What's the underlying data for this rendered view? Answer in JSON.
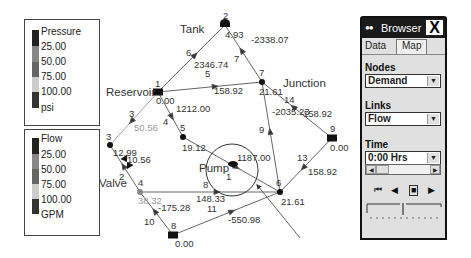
{
  "pressure_legend": {
    "title": "Pressure",
    "ticks": [
      "25.00",
      "50.00",
      "75.00",
      "100.00"
    ],
    "unit": "psi",
    "colors": [
      "#222222",
      "#888888",
      "#666666",
      "#cccccc",
      "#333333"
    ]
  },
  "flow_legend": {
    "title": "Flow",
    "ticks": [
      "25.00",
      "50.00",
      "75.00",
      "100.00"
    ],
    "unit": "GPM",
    "colors": [
      "#222222",
      "#888888",
      "#666666",
      "#cccccc",
      "#333333"
    ]
  },
  "network": {
    "names": {
      "tank": "Tank",
      "reservoir": "Reservoir",
      "junction": "Junction",
      "pump": "Pump",
      "valve": "Valve"
    },
    "nodes": [
      {
        "id": "1",
        "type": "reservoir",
        "value": "0.00"
      },
      {
        "id": "2",
        "type": "tank",
        "value": "4.93"
      },
      {
        "id": "3",
        "type": "junction",
        "value": "12.99"
      },
      {
        "id": "4",
        "type": "junction",
        "value": "38.32"
      },
      {
        "id": "5",
        "type": "junction",
        "value": "19.12"
      },
      {
        "id": "6",
        "type": "junction",
        "value": "21.61"
      },
      {
        "id": "7",
        "type": "junction",
        "value": "21.61"
      },
      {
        "id": "8",
        "type": "reservoir",
        "value": "0.00"
      },
      {
        "id": "9",
        "type": "reservoir",
        "value": "0.00"
      }
    ],
    "links": [
      {
        "id": "1",
        "type": "pump",
        "value": "1187.00"
      },
      {
        "id": "2",
        "type": "valve",
        "value": "10.56"
      },
      {
        "id": "3",
        "type": "pipe",
        "value": "50.56"
      },
      {
        "id": "4",
        "type": "pipe",
        "value": "1212.00"
      },
      {
        "id": "5",
        "type": "pipe",
        "value": "158.92"
      },
      {
        "id": "6",
        "type": "pipe",
        "value": "2346.74"
      },
      {
        "id": "7",
        "type": "pipe",
        "value": "-2338.07"
      },
      {
        "id": "8",
        "type": "pipe",
        "value": "148.33"
      },
      {
        "id": "9",
        "type": "pipe",
        "value": "-2035.23"
      },
      {
        "id": "10",
        "type": "pipe",
        "value": "-175.28"
      },
      {
        "id": "11",
        "type": "pipe",
        "value": "-550.98"
      },
      {
        "id": "13",
        "type": "pipe",
        "value": "158.92"
      },
      {
        "id": "14",
        "type": "pipe",
        "value": "158.92"
      }
    ]
  },
  "browser": {
    "title": "Browser",
    "close_label": "X",
    "tabs": [
      "Data",
      "Map"
    ],
    "active_tab": "Map",
    "nodes_label": "Nodes",
    "nodes_value": "Demand",
    "links_label": "Links",
    "links_value": "Flow",
    "time_label": "Time",
    "time_value": "0:00 Hrs",
    "controls": {
      "rewind": "⏮",
      "back": "◀",
      "stop": "■",
      "forward": "▶"
    },
    "dropdown_arrow": "▼",
    "scroll_left": "◀",
    "scroll_right": "▶"
  }
}
